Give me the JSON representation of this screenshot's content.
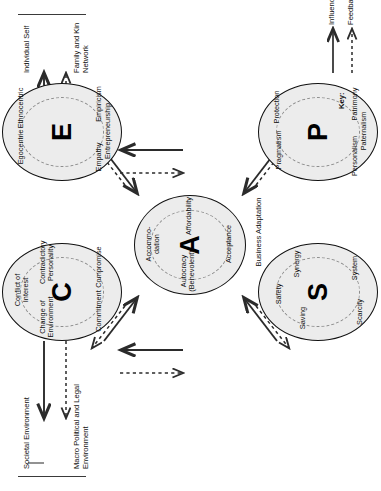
{
  "diagram": {
    "nodes": [
      {
        "id": "C",
        "letter": "C",
        "satellites": [
          "Conflict of Interest",
          "Contradictory Personality",
          "Compromise",
          "Commitment",
          "Change of Environment"
        ]
      },
      {
        "id": "E",
        "letter": "E",
        "satellites": [
          "Egocentric",
          "Ethnocentric",
          "Empiricism",
          "Entrepreneurship",
          "Empathy"
        ]
      },
      {
        "id": "A",
        "letter": "A",
        "satellites": [
          "Accommo-dation",
          "Affordability",
          "Acceptance",
          "Autocracy (Benevolent)"
        ]
      },
      {
        "id": "S",
        "letter": "S",
        "satellites": [
          "Safety",
          "Synergy",
          "System",
          "Scarcity",
          "Saving"
        ]
      },
      {
        "id": "P",
        "letter": "P",
        "satellites": [
          "Pragmatism",
          "Protection",
          "Patrimony",
          "Paternalism",
          "Personalism"
        ]
      }
    ],
    "environments": {
      "societal": "Societal Environment",
      "macro": "Macro Political and Legal Environment",
      "individual": "Individual Self",
      "family": "Family and Kin Network",
      "business": "Business Adaptation"
    },
    "key": {
      "title": "Key:",
      "influence": "Influence",
      "feedback": "Feedback"
    },
    "colors": {
      "node_fill": "#ececec",
      "node_stroke": "#111111",
      "ring_stroke": "#8d8d8d",
      "arrow": "#2b2b2b"
    }
  }
}
